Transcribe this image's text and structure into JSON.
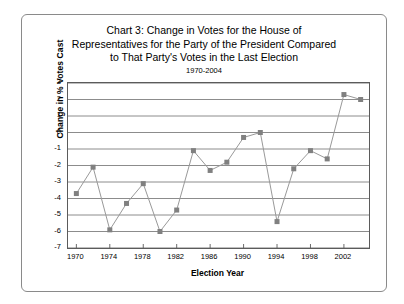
{
  "chart_data": {
    "type": "line",
    "title": "Chart 3: Change in Votes for the House of Representatives for the Party of the President Compared to That Party's Votes in the Last Election",
    "title_lines": [
      "Chart 3: Change in Votes for the House of",
      "Representatives for the Party of the President Compared",
      "to That Party's Votes in the Last Election"
    ],
    "subtitle": "1970-2004",
    "xlabel": "Election Year",
    "ylabel": "Change in % Votes Cast",
    "xlim": [
      1969,
      2005
    ],
    "ylim": [
      -7,
      3
    ],
    "ytick_step": 1,
    "xtick_step": 4,
    "grid": "horizontal",
    "legend": "none",
    "marker": "square",
    "series_color": "#808080",
    "line_color": "#999999",
    "x": [
      1970,
      1972,
      1974,
      1976,
      1978,
      1980,
      1982,
      1984,
      1986,
      1988,
      1990,
      1992,
      1994,
      1996,
      1998,
      2000,
      2002,
      2004
    ],
    "values": [
      -3.7,
      -2.1,
      -5.9,
      -4.3,
      -3.1,
      -6.0,
      -4.7,
      -1.1,
      -2.3,
      -1.8,
      -0.3,
      0.0,
      -5.4,
      -2.2,
      -1.1,
      -1.6,
      2.3,
      2.0
    ],
    "yticks": [
      "3",
      "2",
      "1",
      "0",
      "-1",
      "-2",
      "-3",
      "-4",
      "-5",
      "-6",
      "-7"
    ],
    "xticks": [
      "1970",
      "1974",
      "1978",
      "1982",
      "1986",
      "1990",
      "1994",
      "1998",
      "2002"
    ]
  }
}
